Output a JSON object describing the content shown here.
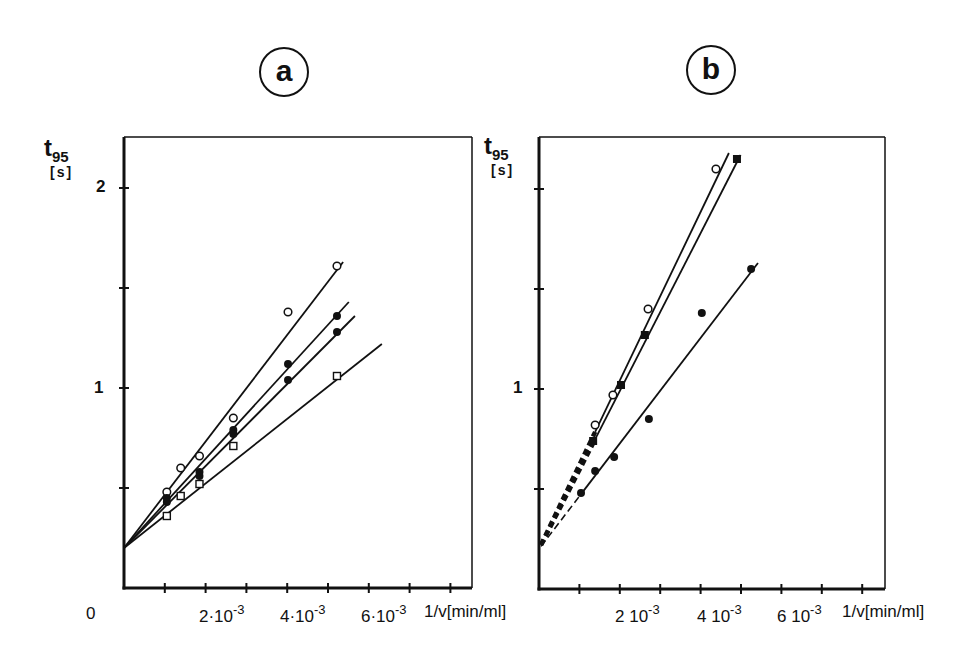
{
  "figure": {
    "panels": [
      {
        "id": "a",
        "letter": "a",
        "ylabel_main": "t",
        "ylabel_sub": "95",
        "ylabel_unit": "[s]",
        "y_tick_labels": [
          {
            "value": 1,
            "text": "1"
          },
          {
            "value": 2,
            "text": "2"
          }
        ],
        "x_origin_label": "0",
        "x_tick_labels": [
          {
            "value": 2,
            "mant": "2·10",
            "exp": "-3"
          },
          {
            "value": 4,
            "mant": "4·10",
            "exp": "-3"
          },
          {
            "value": 6,
            "mant": "6·10",
            "exp": "-3"
          }
        ],
        "xlabel": "1/v[min/ml]"
      },
      {
        "id": "b",
        "letter": "b",
        "ylabel_main": "t",
        "ylabel_sub": "95",
        "ylabel_unit": "[s]",
        "y_tick_labels": [
          {
            "value": 1,
            "text": "1"
          }
        ],
        "x_tick_labels": [
          {
            "value": 2,
            "mant": "2 10",
            "exp": "-3"
          },
          {
            "value": 4,
            "mant": "4 10",
            "exp": "-3"
          },
          {
            "value": 6,
            "mant": "6 10",
            "exp": "-3"
          }
        ],
        "xlabel": "1/v[min/ml]"
      }
    ]
  },
  "chart_data": [
    {
      "type": "scatter",
      "panel": "a",
      "title": "a",
      "xlabel": "1/v [min/ml]",
      "ylabel": "t95 [s]",
      "x_unit_scale": "1e-3",
      "xlim": [
        0,
        8.3
      ],
      "ylim": [
        0,
        2.25
      ],
      "x_ticks": [
        1,
        2,
        3,
        4,
        5,
        6,
        7,
        8
      ],
      "x_tick_labels": [
        "2·10^-3",
        "4·10^-3",
        "6·10^-3"
      ],
      "y_ticks": [
        0.5,
        1.0,
        1.5,
        2.0
      ],
      "y_tick_labels": [
        "1",
        "2"
      ],
      "grid": false,
      "legend": null,
      "series": [
        {
          "name": "open circles",
          "marker": "circle-open",
          "x": [
            1.05,
            1.39,
            1.85,
            2.68,
            4.02,
            5.22
          ],
          "y": [
            0.48,
            0.6,
            0.66,
            0.85,
            1.38,
            1.61
          ],
          "fit": {
            "intercept": 0.2,
            "x_end": 5.37,
            "y_end": 1.63,
            "style": "solid"
          }
        },
        {
          "name": "filled circles (upper)",
          "marker": "circle-filled",
          "x": [
            1.05,
            1.85,
            2.68,
            4.02,
            5.22
          ],
          "y": [
            0.45,
            0.58,
            0.79,
            1.12,
            1.36
          ],
          "fit": {
            "intercept": 0.2,
            "x_end": 5.51,
            "y_end": 1.43,
            "style": "solid"
          }
        },
        {
          "name": "filled circles (lower)",
          "marker": "circle-filled",
          "x": [
            1.05,
            1.85,
            2.68,
            4.02,
            5.22
          ],
          "y": [
            0.43,
            0.56,
            0.77,
            1.04,
            1.28
          ],
          "fit": {
            "intercept": 0.2,
            "x_end": 5.66,
            "y_end": 1.36,
            "style": "solid"
          }
        },
        {
          "name": "open squares",
          "marker": "square-open",
          "x": [
            1.05,
            1.39,
            1.85,
            2.68,
            5.22
          ],
          "y": [
            0.36,
            0.46,
            0.52,
            0.71,
            1.06
          ],
          "fit": {
            "intercept": 0.2,
            "x_end": 6.32,
            "y_end": 1.22,
            "style": "solid"
          }
        }
      ]
    },
    {
      "type": "scatter",
      "panel": "b",
      "title": "b",
      "xlabel": "1/v [min/ml]",
      "ylabel": "t95 [s]",
      "x_unit_scale": "1e-3",
      "xlim": [
        0,
        8.6
      ],
      "ylim": [
        0,
        2.25
      ],
      "x_ticks": [
        1,
        2,
        3,
        4,
        5,
        6,
        7,
        8
      ],
      "x_tick_labels": [
        "2 10^-3",
        "4 10^-3",
        "6 10^-3"
      ],
      "y_ticks": [
        0.5,
        1.0,
        1.5,
        2.0
      ],
      "y_tick_labels": [
        "1"
      ],
      "grid": false,
      "legend": null,
      "series": [
        {
          "name": "open circles",
          "marker": "circle-open",
          "x": [
            1.39,
            1.83,
            2.7,
            4.38
          ],
          "y": [
            0.82,
            0.97,
            1.4,
            2.1
          ],
          "fit": {
            "intercept": 0.2,
            "x_start_solid": 1.39,
            "x_end": 4.7,
            "y_end": 2.18,
            "style": "solid",
            "extrapolation": "thick dashed"
          }
        },
        {
          "name": "filled squares",
          "marker": "square-filled",
          "x": [
            1.34,
            2.03,
            2.62,
            4.9
          ],
          "y": [
            0.74,
            1.02,
            1.27,
            2.15
          ],
          "fit": {
            "intercept": 0.2,
            "x_start_solid": 1.34,
            "x_end": 4.99,
            "y_end": 2.17,
            "style": "solid",
            "extrapolation": "thick dashed"
          }
        },
        {
          "name": "filled circles",
          "marker": "circle-filled",
          "x": [
            1.04,
            1.39,
            1.86,
            2.72,
            4.03,
            5.25
          ],
          "y": [
            0.48,
            0.59,
            0.66,
            0.85,
            1.38,
            1.6
          ],
          "fit": {
            "intercept": 0.2,
            "x_start_solid": 1.04,
            "x_end": 5.42,
            "y_end": 1.63,
            "style": "solid",
            "extrapolation": "thin dashed"
          }
        }
      ]
    }
  ]
}
